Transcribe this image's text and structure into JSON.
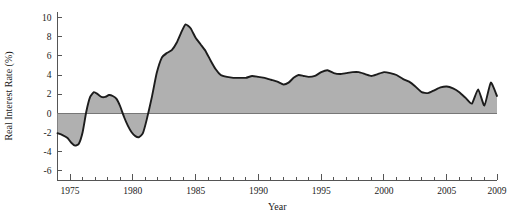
{
  "chart_data": {
    "type": "area",
    "title": "",
    "xlabel": "Year",
    "ylabel": "Real Interest Rate (%)",
    "xlim": [
      1974,
      2009
    ],
    "ylim": [
      -7,
      10.6
    ],
    "grid": false,
    "legend": "none",
    "x_major_ticks": [
      1975,
      1980,
      1985,
      1990,
      1995,
      2000,
      2005,
      2009
    ],
    "x_major_tick_labels": [
      "1975",
      "1980",
      "1985",
      "1990",
      "1995",
      "2000",
      "2005",
      "2009"
    ],
    "x_minor_tick_interval": 1,
    "y_ticks": [
      10,
      8,
      6,
      4,
      2,
      0,
      -2,
      -4,
      -6
    ],
    "y_tick_labels": [
      "10",
      "8",
      "6",
      "4",
      "2",
      "0",
      "-2",
      "-4",
      "-6"
    ],
    "baseline": 0,
    "series": [
      {
        "name": "Real Interest Rate",
        "line_color": "#1c1c1c",
        "fill_color": "#b0b0b0",
        "x": [
          1974,
          1974.4,
          1974.8,
          1975.1,
          1975.4,
          1975.7,
          1976.0,
          1976.3,
          1976.6,
          1976.9,
          1977.2,
          1977.5,
          1977.8,
          1978.1,
          1978.4,
          1978.7,
          1979.0,
          1979.3,
          1979.6,
          1979.9,
          1980.2,
          1980.5,
          1980.8,
          1981.1,
          1981.5,
          1981.9,
          1982.3,
          1982.7,
          1983.1,
          1983.5,
          1983.9,
          1984.2,
          1984.6,
          1985.0,
          1985.4,
          1985.8,
          1986.2,
          1986.6,
          1987.0,
          1987.5,
          1988.0,
          1988.5,
          1989.0,
          1989.5,
          1990.0,
          1990.5,
          1991.0,
          1991.5,
          1992.0,
          1992.4,
          1992.8,
          1993.2,
          1993.6,
          1994.0,
          1994.5,
          1995.0,
          1995.5,
          1996.0,
          1996.5,
          1997.0,
          1997.5,
          1998.0,
          1998.5,
          1999.0,
          1999.5,
          2000.0,
          2000.5,
          2001.0,
          2001.5,
          2002.0,
          2002.5,
          2003.0,
          2003.5,
          2004.0,
          2004.5,
          2005.0,
          2005.5,
          2006.0,
          2006.5,
          2007.0,
          2007.5,
          2008.0,
          2008.5,
          2009.0
        ],
        "y": [
          -2.1,
          -2.3,
          -2.6,
          -3.1,
          -3.4,
          -3.2,
          -2.0,
          0.2,
          1.7,
          2.2,
          2.0,
          1.7,
          1.7,
          1.9,
          1.8,
          1.5,
          0.7,
          -0.4,
          -1.3,
          -2.0,
          -2.4,
          -2.5,
          -2.1,
          -0.7,
          1.6,
          4.2,
          5.8,
          6.3,
          6.6,
          7.4,
          8.6,
          9.3,
          8.9,
          7.9,
          7.2,
          6.5,
          5.5,
          4.6,
          4.0,
          3.8,
          3.7,
          3.7,
          3.7,
          3.9,
          3.8,
          3.7,
          3.5,
          3.3,
          3.0,
          3.2,
          3.7,
          4.0,
          3.9,
          3.8,
          3.9,
          4.3,
          4.5,
          4.2,
          4.1,
          4.2,
          4.3,
          4.3,
          4.1,
          3.9,
          4.1,
          4.3,
          4.2,
          4.0,
          3.6,
          3.3,
          2.8,
          2.2,
          2.1,
          2.4,
          2.7,
          2.8,
          2.6,
          2.2,
          1.6,
          1.0,
          2.5,
          0.8,
          3.2,
          1.8
        ]
      }
    ]
  }
}
